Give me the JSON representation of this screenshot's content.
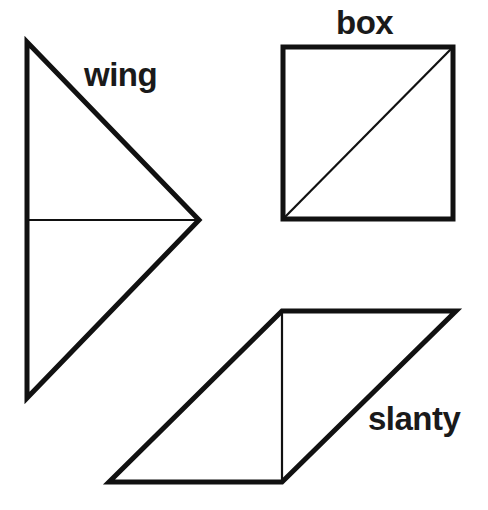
{
  "diagram": {
    "background": "#ffffff",
    "stroke_color": "#111111",
    "shapes": [
      {
        "id": "wing",
        "label": "wing",
        "type": "triangle",
        "vertices": [
          [
            27,
            42
          ],
          [
            199,
            220
          ],
          [
            27,
            398
          ]
        ],
        "inner_line": [
          [
            27,
            220
          ],
          [
            199,
            220
          ]
        ]
      },
      {
        "id": "box",
        "label": "box",
        "type": "square",
        "vertices": [
          [
            283,
            47
          ],
          [
            453,
            47
          ],
          [
            453,
            219
          ],
          [
            283,
            219
          ]
        ],
        "inner_line": [
          [
            283,
            219
          ],
          [
            453,
            47
          ]
        ]
      },
      {
        "id": "slanty",
        "label": "slanty",
        "type": "parallelogram",
        "vertices": [
          [
            282,
            311
          ],
          [
            456,
            311
          ],
          [
            282,
            482
          ],
          [
            109,
            482
          ]
        ],
        "inner_line": [
          [
            282,
            311
          ],
          [
            282,
            482
          ]
        ]
      }
    ]
  }
}
